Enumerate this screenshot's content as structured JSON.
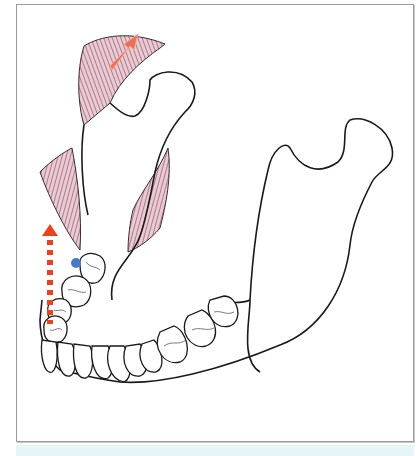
{
  "figure": {
    "colors": {
      "outline": "#1a1a1a",
      "muscle_fill": "#e9c4cf",
      "muscle_lines": "#5a3a44",
      "arrow_solid": "#ec7058",
      "arrow_dashed": "#e8431e",
      "marker_dot": "#4a78c8",
      "frame_border": "#9a9a9a",
      "bottom_strip": "#e6f5f7"
    },
    "elements": [
      {
        "name": "mandible-outline",
        "type": "bone"
      },
      {
        "name": "upper-muscle",
        "type": "muscle"
      },
      {
        "name": "left-muscle",
        "type": "muscle"
      },
      {
        "name": "middle-muscle",
        "type": "muscle"
      },
      {
        "name": "teeth-row",
        "type": "teeth",
        "count": 14
      },
      {
        "name": "upward-right-arrow",
        "type": "arrow",
        "style": "solid"
      },
      {
        "name": "vertical-dashed-arrow",
        "type": "arrow",
        "style": "dashed"
      },
      {
        "name": "blue-marker-dot",
        "type": "marker"
      }
    ]
  }
}
